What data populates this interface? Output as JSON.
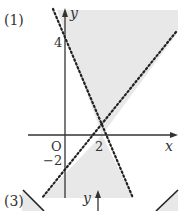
{
  "panels": [
    {
      "label": "(1)",
      "axes": {
        "x_label": "x",
        "y_label": "y",
        "origin_label": "O"
      },
      "ticks": {
        "y_pos": "4",
        "y_neg": "−2",
        "x_pos": "2"
      },
      "lines": [
        {
          "desc": "y = -2x + 4",
          "style": "dotted"
        },
        {
          "desc": "y = x - 2",
          "style": "dotted"
        }
      ],
      "shaded_regions": [
        "above both lines",
        "below both lines"
      ]
    },
    {
      "label": "(3)",
      "axes": {
        "y_label": "y"
      }
    }
  ],
  "colors": {
    "shade": "#e6e6e6",
    "line": "#222222",
    "axis": "#333333"
  }
}
